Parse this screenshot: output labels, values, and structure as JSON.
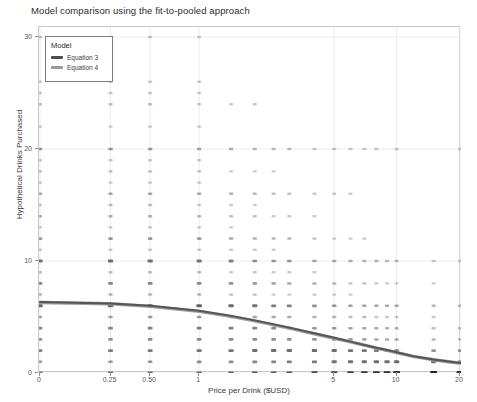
{
  "chart_data": {
    "type": "scatter",
    "title": "Model comparison using the fit-to-pooled approach",
    "xlabel": "Price per Drink ($USD)",
    "ylabel": "Hypothetical Drinks Purchased",
    "xscale": "log-like",
    "xticks": [
      "0",
      "0.25",
      "0.50",
      "1",
      "5",
      "10",
      "20"
    ],
    "xtick_values": [
      0,
      0.25,
      0.5,
      1,
      5,
      10,
      20
    ],
    "yticks": [
      "0",
      "10",
      "20",
      "30"
    ],
    "ytick_values": [
      0,
      10,
      20,
      30
    ],
    "ylim": [
      0,
      31
    ],
    "grid": true,
    "legend": {
      "title": "Model",
      "position": "top-left",
      "entries": [
        {
          "label": "Equation 3",
          "color": "#4d4d4d"
        },
        {
          "label": "Equation 4",
          "color": "#9a9a9a"
        }
      ]
    },
    "series": [
      {
        "name": "Equation 3",
        "type": "line",
        "color": "#4d4d4d",
        "points": [
          {
            "x": 0.0,
            "y": 6.35
          },
          {
            "x": 0.25,
            "y": 6.2
          },
          {
            "x": 0.5,
            "y": 6.0
          },
          {
            "x": 1.0,
            "y": 5.55
          },
          {
            "x": 1.5,
            "y": 5.1
          },
          {
            "x": 2.0,
            "y": 4.7
          },
          {
            "x": 3.0,
            "y": 4.05
          },
          {
            "x": 4.0,
            "y": 3.55
          },
          {
            "x": 5.0,
            "y": 3.15
          },
          {
            "x": 6.0,
            "y": 2.8
          },
          {
            "x": 7.0,
            "y": 2.5
          },
          {
            "x": 8.0,
            "y": 2.25
          },
          {
            "x": 9.0,
            "y": 2.05
          },
          {
            "x": 10.0,
            "y": 1.85
          },
          {
            "x": 12.0,
            "y": 1.5
          },
          {
            "x": 15.0,
            "y": 1.2
          },
          {
            "x": 18.0,
            "y": 1.0
          },
          {
            "x": 20.0,
            "y": 0.9
          }
        ]
      },
      {
        "name": "Equation 4",
        "type": "line",
        "color": "#9a9a9a",
        "points": [
          {
            "x": 0.0,
            "y": 6.3
          },
          {
            "x": 0.25,
            "y": 6.18
          },
          {
            "x": 0.5,
            "y": 5.95
          },
          {
            "x": 1.0,
            "y": 5.5
          },
          {
            "x": 1.5,
            "y": 5.05
          },
          {
            "x": 2.0,
            "y": 4.65
          },
          {
            "x": 3.0,
            "y": 4.0
          },
          {
            "x": 4.0,
            "y": 3.5
          },
          {
            "x": 5.0,
            "y": 3.1
          },
          {
            "x": 6.0,
            "y": 2.78
          },
          {
            "x": 7.0,
            "y": 2.48
          },
          {
            "x": 8.0,
            "y": 2.22
          },
          {
            "x": 9.0,
            "y": 2.02
          },
          {
            "x": 10.0,
            "y": 1.82
          },
          {
            "x": 12.0,
            "y": 1.48
          },
          {
            "x": 15.0,
            "y": 1.18
          },
          {
            "x": 18.0,
            "y": 0.98
          },
          {
            "x": 20.0,
            "y": 0.88
          }
        ]
      },
      {
        "name": "Observed responses",
        "type": "scatter",
        "color": "#111111",
        "note": "Discrete jittered points; opacity encodes count of respondents at each (price, drinks) cell.",
        "price_levels": [
          0,
          0.25,
          0.5,
          1,
          1.5,
          2,
          2.5,
          3,
          4,
          5,
          6,
          7,
          8,
          9,
          10,
          15,
          20
        ],
        "drink_levels": [
          0,
          1,
          2,
          3,
          4,
          5,
          6,
          7,
          8,
          9,
          10,
          11,
          12,
          13,
          14,
          15,
          16,
          17,
          18,
          19,
          20,
          21,
          22,
          23,
          24,
          25,
          26,
          27,
          28,
          29,
          30
        ],
        "cells": [
          {
            "x": 0,
            "counts": [
              20,
              8,
              16,
              10,
              14,
              6,
              28,
              3,
              14,
              2,
              22,
              1,
              8,
              1,
              4,
              1,
              5,
              1,
              2,
              1,
              9,
              0,
              1,
              0,
              2,
              1,
              1,
              0,
              0,
              0,
              2
            ]
          },
          {
            "x": 0.25,
            "counts": [
              22,
              9,
              18,
              11,
              15,
              7,
              30,
              3,
              15,
              2,
              24,
              1,
              9,
              1,
              4,
              2,
              6,
              1,
              2,
              1,
              9,
              0,
              1,
              0,
              2,
              1,
              1,
              0,
              0,
              0,
              2
            ]
          },
          {
            "x": 0.5,
            "counts": [
              24,
              10,
              19,
              12,
              16,
              8,
              31,
              3,
              15,
              2,
              24,
              1,
              9,
              1,
              4,
              2,
              6,
              1,
              2,
              1,
              8,
              0,
              1,
              0,
              2,
              1,
              1,
              0,
              0,
              0,
              1
            ]
          },
          {
            "x": 1,
            "counts": [
              26,
              12,
              22,
              14,
              18,
              9,
              30,
              3,
              14,
              2,
              21,
              1,
              8,
              1,
              3,
              1,
              5,
              1,
              2,
              1,
              6,
              0,
              1,
              0,
              1,
              1,
              1,
              0,
              0,
              0,
              1
            ]
          },
          {
            "x": 1.5,
            "counts": [
              28,
              13,
              24,
              14,
              18,
              8,
              26,
              2,
              11,
              1,
              16,
              1,
              6,
              1,
              2,
              1,
              4,
              0,
              1,
              0,
              4,
              0,
              0,
              0,
              1,
              0,
              0,
              0,
              0,
              0,
              0
            ]
          },
          {
            "x": 2,
            "counts": [
              31,
              15,
              26,
              14,
              17,
              7,
              23,
              2,
              9,
              1,
              13,
              1,
              4,
              0,
              2,
              1,
              3,
              0,
              1,
              0,
              3,
              0,
              0,
              0,
              1,
              0,
              0,
              0,
              0,
              0,
              0
            ]
          },
          {
            "x": 2.5,
            "counts": [
              33,
              16,
              27,
              13,
              15,
              6,
              19,
              1,
              7,
              1,
              10,
              1,
              3,
              0,
              1,
              0,
              2,
              0,
              1,
              0,
              2,
              0,
              0,
              0,
              0,
              0,
              0,
              0,
              0,
              0,
              0
            ]
          },
          {
            "x": 3,
            "counts": [
              36,
              18,
              27,
              12,
              14,
              5,
              17,
              1,
              6,
              1,
              9,
              0,
              3,
              0,
              1,
              0,
              2,
              0,
              0,
              0,
              2,
              0,
              0,
              0,
              0,
              0,
              0,
              0,
              0,
              0,
              0
            ]
          },
          {
            "x": 4,
            "counts": [
              41,
              20,
              26,
              11,
              11,
              4,
              13,
              1,
              4,
              1,
              6,
              0,
              2,
              0,
              1,
              0,
              1,
              0,
              0,
              0,
              1,
              0,
              0,
              0,
              0,
              0,
              0,
              0,
              0,
              0,
              0
            ]
          },
          {
            "x": 5,
            "counts": [
              46,
              22,
              25,
              9,
              9,
              3,
              10,
              1,
              3,
              0,
              5,
              0,
              1,
              0,
              0,
              0,
              1,
              0,
              0,
              0,
              1,
              0,
              0,
              0,
              0,
              0,
              0,
              0,
              0,
              0,
              0
            ]
          },
          {
            "x": 6,
            "counts": [
              50,
              23,
              23,
              8,
              7,
              2,
              8,
              1,
              2,
              0,
              4,
              0,
              1,
              0,
              0,
              0,
              1,
              0,
              0,
              0,
              1,
              0,
              0,
              0,
              0,
              0,
              0,
              0,
              0,
              0,
              0
            ]
          },
          {
            "x": 7,
            "counts": [
              54,
              24,
              21,
              7,
              6,
              2,
              7,
              0,
              2,
              0,
              3,
              0,
              1,
              0,
              0,
              0,
              0,
              0,
              0,
              0,
              1,
              0,
              0,
              0,
              0,
              0,
              0,
              0,
              0,
              0,
              0
            ]
          },
          {
            "x": 8,
            "counts": [
              57,
              25,
              19,
              6,
              5,
              1,
              6,
              0,
              1,
              0,
              3,
              0,
              0,
              0,
              0,
              0,
              0,
              0,
              0,
              0,
              1,
              0,
              0,
              0,
              0,
              0,
              0,
              0,
              0,
              0,
              0
            ]
          },
          {
            "x": 9,
            "counts": [
              60,
              25,
              17,
              5,
              4,
              1,
              5,
              0,
              1,
              0,
              2,
              0,
              0,
              0,
              0,
              0,
              0,
              0,
              0,
              0,
              0,
              0,
              0,
              0,
              0,
              0,
              0,
              0,
              0,
              0,
              0
            ]
          },
          {
            "x": 10,
            "counts": [
              63,
              25,
              16,
              5,
              4,
              1,
              5,
              0,
              1,
              0,
              2,
              0,
              0,
              0,
              0,
              0,
              0,
              0,
              0,
              0,
              1,
              0,
              0,
              0,
              0,
              0,
              0,
              0,
              0,
              0,
              0
            ]
          },
          {
            "x": 15,
            "counts": [
              72,
              22,
              11,
              3,
              2,
              1,
              3,
              0,
              1,
              0,
              1,
              0,
              0,
              0,
              0,
              0,
              0,
              0,
              0,
              0,
              0,
              0,
              0,
              0,
              0,
              0,
              0,
              0,
              0,
              0,
              0
            ]
          },
          {
            "x": 20,
            "counts": [
              78,
              20,
              8,
              2,
              2,
              0,
              2,
              0,
              0,
              0,
              1,
              0,
              0,
              0,
              0,
              0,
              0,
              0,
              0,
              0,
              1,
              0,
              0,
              0,
              0,
              0,
              0,
              0,
              0,
              0,
              0
            ]
          }
        ]
      }
    ]
  }
}
